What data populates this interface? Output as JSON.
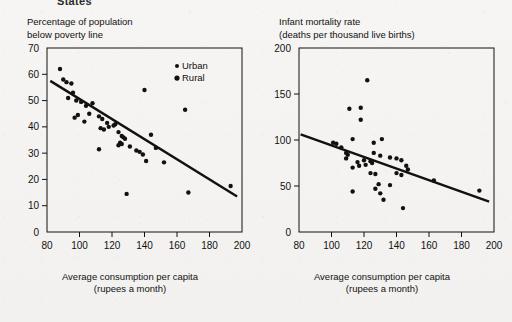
{
  "page": {
    "heading": "States",
    "background_color": "#f4f3f1",
    "ink_color": "#111111"
  },
  "legend": {
    "position": "inside-top-right",
    "entries": [
      {
        "label": "Urban",
        "marker": "small-dot",
        "marker_size": 2.0
      },
      {
        "label": "Rural",
        "marker": "large-dot",
        "marker_size": 2.6
      }
    ]
  },
  "charts": [
    {
      "id": "poverty",
      "title_line1": "Percentage of population",
      "title_line2": "below poverty line",
      "xlabel_line1": "Average consumption per capita",
      "xlabel_line2": "(rupees a month)",
      "chart_data": {
        "type": "scatter",
        "title": "Percentage of population below poverty line",
        "xlabel": "Average consumption per capita (rupees a month)",
        "ylabel": "Percentage of population below poverty line",
        "xlim": [
          80,
          200
        ],
        "ylim": [
          0,
          70
        ],
        "xticks": [
          80,
          100,
          120,
          140,
          160,
          180,
          200
        ],
        "yticks": [
          0,
          10,
          20,
          30,
          40,
          50,
          60,
          70
        ],
        "grid": false,
        "legend": [
          "Urban",
          "Rural"
        ],
        "points": [
          [
            88,
            62
          ],
          [
            90,
            58
          ],
          [
            92,
            57
          ],
          [
            95,
            56.5
          ],
          [
            96,
            53
          ],
          [
            93,
            51
          ],
          [
            98,
            50
          ],
          [
            101,
            49.5
          ],
          [
            104,
            48
          ],
          [
            108,
            49
          ],
          [
            99,
            44.5
          ],
          [
            106,
            45
          ],
          [
            97,
            43.5
          ],
          [
            103,
            42
          ],
          [
            112,
            44
          ],
          [
            114,
            43
          ],
          [
            117,
            41.5
          ],
          [
            118,
            40
          ],
          [
            113,
            39.5
          ],
          [
            115,
            39
          ],
          [
            121,
            40.5
          ],
          [
            122,
            41
          ],
          [
            124,
            38
          ],
          [
            126,
            36.5
          ],
          [
            127,
            36
          ],
          [
            128,
            35.5
          ],
          [
            125,
            34
          ],
          [
            126,
            33.5
          ],
          [
            124,
            33
          ],
          [
            131,
            32.5
          ],
          [
            135,
            31
          ],
          [
            137,
            30.5
          ],
          [
            139,
            29.5
          ],
          [
            141,
            27
          ],
          [
            147,
            32
          ],
          [
            144,
            37
          ],
          [
            140,
            54
          ],
          [
            165,
            46.5
          ],
          [
            112,
            31.5
          ],
          [
            129,
            14.5
          ],
          [
            152,
            26.5
          ],
          [
            167,
            15
          ],
          [
            193,
            17.5
          ]
        ],
        "trend_line": {
          "x": [
            82,
            197
          ],
          "y": [
            57.5,
            13.5
          ]
        }
      }
    },
    {
      "id": "infant-mortality",
      "title_line1": "Infant mortality rate",
      "title_line2": "(deaths per thousand live births)",
      "xlabel_line1": "Average consumption per capita",
      "xlabel_line2": "(rupees a month)",
      "chart_data": {
        "type": "scatter",
        "title": "Infant mortality rate (deaths per thousand live births)",
        "xlabel": "Average consumption per capita (rupees a month)",
        "ylabel": "Infant mortality rate (deaths per thousand live births)",
        "xlim": [
          80,
          200
        ],
        "ylim": [
          0,
          200
        ],
        "xticks": [
          80,
          100,
          120,
          140,
          160,
          180,
          200
        ],
        "yticks": [
          0,
          50,
          100,
          150,
          200
        ],
        "grid": false,
        "points": [
          [
            122,
            165
          ],
          [
            111,
            134
          ],
          [
            118,
            135
          ],
          [
            118,
            122
          ],
          [
            103,
            96
          ],
          [
            106,
            92
          ],
          [
            101,
            97
          ],
          [
            113,
            101
          ],
          [
            126,
            97
          ],
          [
            131,
            101
          ],
          [
            109,
            86
          ],
          [
            110,
            84
          ],
          [
            109,
            80
          ],
          [
            116,
            76
          ],
          [
            120,
            78
          ],
          [
            121,
            73
          ],
          [
            124,
            77
          ],
          [
            125,
            75
          ],
          [
            126,
            86
          ],
          [
            130,
            83
          ],
          [
            113,
            70
          ],
          [
            117,
            72
          ],
          [
            136,
            81
          ],
          [
            140,
            80
          ],
          [
            143,
            78
          ],
          [
            146,
            72
          ],
          [
            147,
            68
          ],
          [
            129,
            52
          ],
          [
            136,
            51
          ],
          [
            127,
            47
          ],
          [
            130,
            42
          ],
          [
            132,
            35
          ],
          [
            113,
            44
          ],
          [
            144,
            26
          ],
          [
            140,
            64
          ],
          [
            143,
            62
          ],
          [
            163,
            56
          ],
          [
            191,
            45
          ],
          [
            124,
            64
          ],
          [
            127,
            63
          ]
        ],
        "trend_line": {
          "x": [
            81,
            197
          ],
          "y": [
            106,
            33
          ]
        }
      }
    }
  ]
}
